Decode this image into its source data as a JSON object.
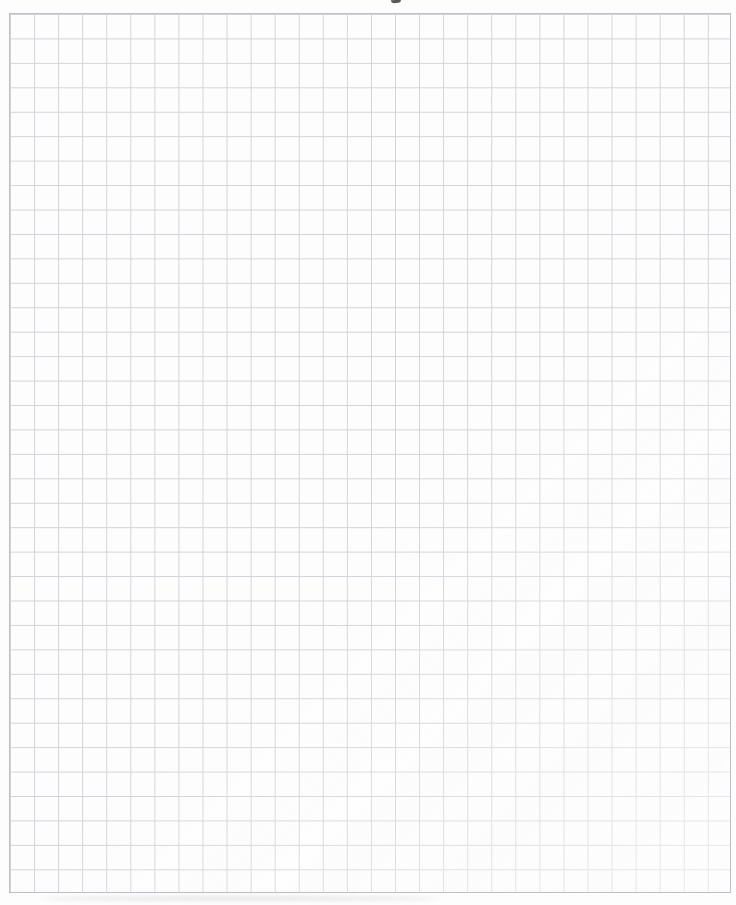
{
  "page": {
    "background_color": "#fdfdfd",
    "visible_text": "",
    "grid": {
      "line_color": "#ced2d6",
      "border_color": "#b9bdc2",
      "columns": 30,
      "rows": 36,
      "left_px": 9,
      "top_px": 13,
      "width_px": 722,
      "height_px": 880
    },
    "artifacts": {
      "top_edge_ink_mark": {
        "color": "#575757",
        "left_px": 391,
        "top_px": 0,
        "width_px": 10,
        "height_px": 3
      },
      "bottom_scan_shadow": {
        "color": "rgba(165,165,165,0.22)",
        "left_px": 40,
        "top_px": 896,
        "width_px": 400,
        "height_px": 5
      }
    }
  }
}
